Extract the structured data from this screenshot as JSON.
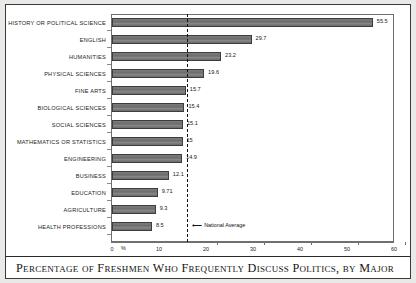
{
  "chart_data": {
    "type": "bar",
    "orientation": "horizontal",
    "title": "",
    "caption": "Percentage of Freshmen Who Frequently Discuss Politics, by Major",
    "xlabel": "%",
    "ylabel": "",
    "xlim": [
      0,
      60
    ],
    "xticks": [
      0,
      10,
      20,
      30,
      40,
      50,
      60
    ],
    "xtick_labels": [
      "0",
      "10",
      "20",
      "30",
      "40",
      "50",
      "60"
    ],
    "grid": false,
    "legend": null,
    "bar_color": "#6e6e6e",
    "bar_edge_color": "#3d3d3d",
    "categories": [
      "HISTORY OR POLITICAL SCIENCE",
      "ENGLISH",
      "HUMANITIES",
      "PHYSICAL SCIENCES",
      "FINE ARTS",
      "BIOLOGICAL SCIENCES",
      "SOCIAL SCIENCES",
      "MATHEMATICS OR STATISTICS",
      "ENGINEERING",
      "BUSINESS",
      "EDUCATION",
      "AGRICULTURE",
      "HEALTH PROFESSIONS"
    ],
    "values": [
      55.5,
      29.7,
      23.2,
      19.6,
      15.7,
      15.4,
      15.1,
      15,
      14.9,
      12.1,
      9.71,
      9.3,
      8.5
    ],
    "value_labels": [
      "55.5",
      "29.7",
      "23.2",
      "19.6",
      "15.7",
      "15.4",
      "15.1",
      "15",
      "14.9",
      "12.1",
      "9.71",
      "9.3",
      "8.5"
    ],
    "annotations": [
      {
        "name": "national-average",
        "label": "National Average",
        "value": 16,
        "style": "dashed vertical line with left arrow"
      }
    ]
  },
  "axis": {
    "percent_symbol": "%"
  }
}
